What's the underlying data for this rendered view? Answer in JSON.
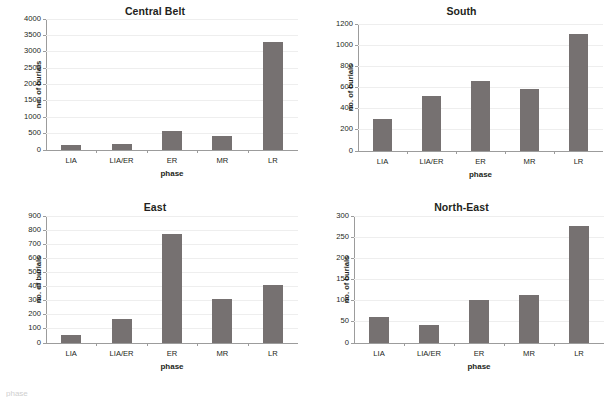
{
  "figure": {
    "bar_color": "#767171",
    "gridline_color": "#eeeeee",
    "axis_color": "#9c9c9c",
    "bottom_caption": "phase"
  },
  "chart_data": [
    {
      "type": "bar",
      "title": "Central Belt",
      "xlabel": "phase",
      "ylabel": "no. of burials",
      "categories": [
        "LIA",
        "LIA/ER",
        "ER",
        "MR",
        "LR"
      ],
      "values": [
        145,
        185,
        580,
        415,
        3300
      ],
      "ylim": [
        0,
        4000
      ],
      "ytick_step": 500,
      "yticks": [
        0,
        500,
        1000,
        1500,
        2000,
        2500,
        3000,
        3500,
        4000
      ],
      "grid": true,
      "legend": "none"
    },
    {
      "type": "bar",
      "title": "South",
      "xlabel": "phase",
      "ylabel": "no. of burials",
      "categories": [
        "LIA",
        "LIA/ER",
        "ER",
        "MR",
        "LR"
      ],
      "values": [
        305,
        520,
        665,
        590,
        1105
      ],
      "ylim": [
        0,
        1200
      ],
      "ytick_step": 200,
      "yticks": [
        0,
        200,
        400,
        600,
        800,
        1000,
        1200
      ],
      "grid": true,
      "legend": "none"
    },
    {
      "type": "bar",
      "title": "East",
      "xlabel": "phase",
      "ylabel": "no. of burials",
      "categories": [
        "LIA",
        "LIA/ER",
        "ER",
        "MR",
        "LR"
      ],
      "values": [
        55,
        170,
        770,
        315,
        408
      ],
      "ylim": [
        0,
        900
      ],
      "ytick_step": 100,
      "yticks": [
        0,
        100,
        200,
        300,
        400,
        500,
        600,
        700,
        800,
        900
      ],
      "grid": true,
      "legend": "none"
    },
    {
      "type": "bar",
      "title": "North-East",
      "xlabel": "phase",
      "ylabel": "no. of burials",
      "categories": [
        "LIA",
        "LIA/ER",
        "ER",
        "MR",
        "LR"
      ],
      "values": [
        61,
        42,
        101,
        113,
        277
      ],
      "ylim": [
        0,
        300
      ],
      "ytick_step": 50,
      "yticks": [
        0,
        50,
        100,
        150,
        200,
        250,
        300
      ],
      "grid": true,
      "legend": "none"
    }
  ]
}
